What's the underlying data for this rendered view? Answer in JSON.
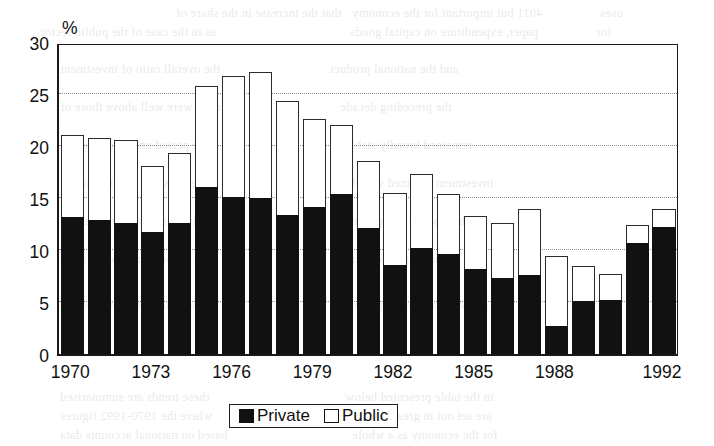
{
  "figure": {
    "background_color": "#ffffff",
    "ink_color": "#111111",
    "grid_color": "#8e8e8e"
  },
  "legend": {
    "position": "bottom-center",
    "items": [
      {
        "label": "Private",
        "swatch": "filled-black-square-icon",
        "color": "#111111"
      },
      {
        "label": "Public",
        "swatch": "hollow-white-square-icon",
        "color": "#ffffff"
      }
    ]
  },
  "bleed_text": [
    {
      "x": 176,
      "y": 4,
      "text": "that the increase in the share of"
    },
    {
      "x": 352,
      "y": 4,
      "text": "4011 but important for the economy"
    },
    {
      "x": 600,
      "y": 4,
      "text": "uses"
    },
    {
      "x": 40,
      "y": 23,
      "text": "as in the case of the public sector"
    },
    {
      "x": 350,
      "y": 23,
      "text": "paper, expenditure on capital goods"
    },
    {
      "x": 596,
      "y": 23,
      "text": "for"
    },
    {
      "x": 60,
      "y": 60,
      "text": "the overall ratio of investment"
    },
    {
      "x": 330,
      "y": 60,
      "text": "and the national product"
    },
    {
      "x": 60,
      "y": 98,
      "text": "rates were well above those of"
    },
    {
      "x": 340,
      "y": 98,
      "text": "the preceding decade"
    },
    {
      "x": 60,
      "y": 136,
      "text": "the period under review and"
    },
    {
      "x": 345,
      "y": 136,
      "text": "remained broadly stable"
    },
    {
      "x": 60,
      "y": 174,
      "text": "here the share of government"
    },
    {
      "x": 345,
      "y": 174,
      "text": "investment declined sharply"
    },
    {
      "x": 60,
      "y": 212,
      "text": "private sector investment in"
    },
    {
      "x": 350,
      "y": 212,
      "text": "machinery and equipment"
    },
    {
      "x": 60,
      "y": 250,
      "text": "was accompanied by a fall in"
    },
    {
      "x": 345,
      "y": 250,
      "text": "construction activity"
    },
    {
      "x": 60,
      "y": 296,
      "text": "in the latter part of the period"
    },
    {
      "x": 350,
      "y": 296,
      "text": "a recovery became apparent"
    },
    {
      "x": 60,
      "y": 388,
      "text": "these trends are summarised"
    },
    {
      "x": 345,
      "y": 388,
      "text": "in the table presented below"
    },
    {
      "x": 60,
      "y": 407,
      "text": "where the 1970-1992 figures"
    },
    {
      "x": 350,
      "y": 407,
      "text": "are set out in greater detail"
    },
    {
      "x": 60,
      "y": 426,
      "text": "based on national accounts data"
    },
    {
      "x": 352,
      "y": 426,
      "text": "for the economy as a whole"
    }
  ],
  "chart_data": {
    "type": "bar",
    "subtype": "stacked-vertical",
    "title": "",
    "xlabel": "",
    "ylabel": "%",
    "ylim": [
      0,
      30
    ],
    "yticks": [
      0,
      5,
      10,
      15,
      20,
      25,
      30
    ],
    "ytick_labels": [
      "0",
      "5",
      "10",
      "15",
      "20",
      "25",
      "30"
    ],
    "grid": "horizontal-dotted",
    "gridlines": [
      5,
      10,
      15,
      20,
      25
    ],
    "legend_position": "bottom-center",
    "categories": [
      "1970",
      "1971",
      "1972",
      "1973",
      "1974",
      "1975",
      "1976",
      "1977",
      "1978",
      "1979",
      "1980",
      "1981",
      "1982",
      "1983",
      "1984",
      "1985",
      "1986",
      "1987",
      "1988",
      "1989",
      "1990",
      "1991",
      "1992"
    ],
    "xtick_labels": [
      "1970",
      "1973",
      "1976",
      "1979",
      "1982",
      "1985",
      "1988",
      "1992"
    ],
    "xtick_categories": [
      "1970",
      "1973",
      "1976",
      "1979",
      "1982",
      "1985",
      "1988",
      "1992"
    ],
    "series": [
      {
        "name": "Private",
        "color": "#111111",
        "values": [
          13.2,
          12.9,
          12.6,
          11.7,
          12.6,
          16.1,
          15.1,
          15.0,
          13.4,
          14.1,
          15.4,
          12.1,
          8.6,
          10.2,
          9.6,
          8.2,
          7.3,
          7.6,
          2.7,
          5.1,
          5.2,
          10.7,
          12.2
        ]
      },
      {
        "name": "Public",
        "color": "#ffffff",
        "values": [
          7.9,
          7.9,
          8.0,
          6.4,
          6.7,
          9.7,
          11.6,
          12.1,
          10.9,
          8.5,
          6.6,
          6.5,
          6.9,
          7.1,
          5.8,
          5.1,
          5.3,
          6.3,
          6.7,
          3.4,
          2.5,
          1.7,
          1.7
        ]
      }
    ],
    "totals": [
      21.1,
      20.8,
      20.6,
      18.1,
      19.3,
      25.8,
      26.7,
      27.1,
      24.3,
      22.6,
      22.0,
      18.6,
      15.5,
      17.3,
      15.4,
      13.3,
      12.6,
      13.9,
      9.4,
      8.5,
      7.7,
      12.4,
      13.9
    ]
  },
  "geometry": {
    "plot_left": 57,
    "plot_top": 44,
    "plot_width": 621,
    "plot_height": 312,
    "bar_pitch": 26.9,
    "bar_width": 23.2,
    "bar_offset": 1.6
  }
}
